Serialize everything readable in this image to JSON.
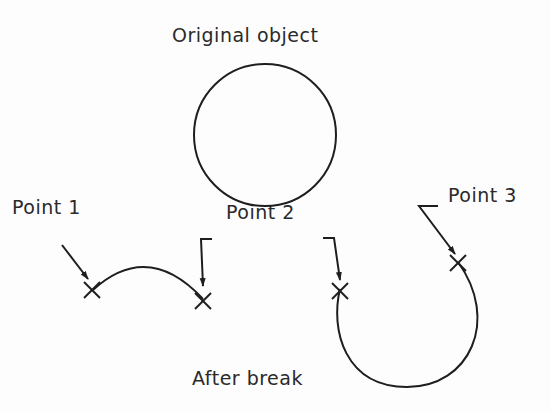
{
  "diagram": {
    "title_top": "Original object",
    "title_bottom": "After break",
    "points": [
      {
        "label": "Point 1"
      },
      {
        "label": "Point 2"
      },
      {
        "label": "Point 3"
      }
    ],
    "stroke_color": "#1e1e1e",
    "text_color": "#2a2a2a"
  }
}
